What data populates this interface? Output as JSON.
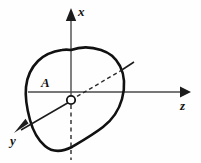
{
  "figure": {
    "name": "cross-section-axes-diagram",
    "background_color": "#fefefe",
    "stroke_color": "#111111",
    "axis_color": "#4a4a4a",
    "width": 201,
    "height": 163
  },
  "axes": [
    {
      "id": "x",
      "label": "x",
      "direction": "up",
      "style": "solid-with-arrow",
      "label_x": 78,
      "label_y": 16
    },
    {
      "id": "z",
      "label": "z",
      "direction": "right",
      "style": "solid-with-arrow",
      "label_x": 180,
      "label_y": 110
    },
    {
      "id": "y",
      "label": "y",
      "direction": "lower-left",
      "style": "solid-with-arrow",
      "label_x": 10,
      "label_y": 145
    }
  ],
  "origin": {
    "label": "",
    "marker": "open-circle",
    "cx": 71,
    "cy": 100,
    "r": 4.2
  },
  "region": {
    "label": "A",
    "label_x": 41,
    "label_y": 87,
    "shape": "irregular-closed-cross-section"
  },
  "inclined_axis": {
    "label": "",
    "dashed_segment": "origin-to-region-edge",
    "solid_segment": "region-edge-to-outside",
    "style": "dashed-then-solid"
  },
  "vertical_construction_line": {
    "style": "dashed",
    "from_y": 104,
    "to_y": 160
  }
}
